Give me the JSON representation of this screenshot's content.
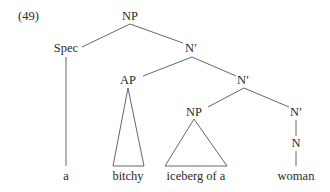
{
  "example_number": "(49)",
  "nodes": {
    "root_np": "NP",
    "spec": "Spec",
    "nbar1": "N′",
    "ap": "AP",
    "nbar2": "N′",
    "inner_np": "NP",
    "nbar3": "N′",
    "n": "N"
  },
  "leaves": {
    "a": "a",
    "bitchy": "bitchy",
    "iceberg": "iceberg of a",
    "woman": "woman"
  },
  "colors": {
    "line": "#555555",
    "text": "#2a2a2a",
    "background": "#ffffff"
  }
}
